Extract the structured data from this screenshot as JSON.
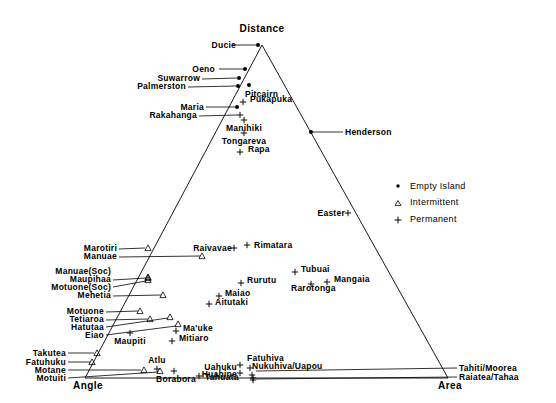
{
  "figure": {
    "type": "ternary-scatter",
    "width": 556,
    "height": 403,
    "background": "#ffffff",
    "ink_color": "#000000"
  },
  "vertices": {
    "top": "Distance",
    "bottom_left": "Angle",
    "bottom_right": "Area"
  },
  "legend": {
    "entries": [
      {
        "marker": "dot",
        "label": "Empty Island"
      },
      {
        "marker": "triangle",
        "label": "Intermittent"
      },
      {
        "marker": "plus",
        "label": "Permanent"
      }
    ]
  },
  "chart_data": {
    "type": "scatter",
    "title": "",
    "xlabel": "",
    "ylabel": "",
    "axes": {
      "top_vertex": "Distance",
      "left_vertex": "Angle",
      "right_vertex": "Area"
    },
    "legend_position": "right",
    "grid": false,
    "marker_classes": [
      "Empty Island",
      "Intermittent",
      "Permanent"
    ],
    "points": [
      {
        "name": "Ducie",
        "class": "Empty Island",
        "x": 258,
        "y": 45,
        "label_x": 236,
        "label_y": 45,
        "label_align": "right",
        "leader": [
          232,
          45,
          256,
          45
        ]
      },
      {
        "name": "Oeno",
        "class": "Empty Island",
        "x": 245,
        "y": 69,
        "label_x": 215,
        "label_y": 69,
        "label_align": "right",
        "leader": [
          219,
          69,
          243,
          69
        ]
      },
      {
        "name": "Suwarrow",
        "class": "Empty Island",
        "x": 239,
        "y": 78,
        "label_x": 200,
        "label_y": 78,
        "label_align": "right",
        "leader": [
          202,
          79,
          237,
          78
        ]
      },
      {
        "name": "Palmerston",
        "class": "Empty Island",
        "x": 238,
        "y": 86,
        "label_x": 186,
        "label_y": 86,
        "label_align": "right",
        "leader": [
          188,
          87,
          236,
          86
        ]
      },
      {
        "name": "Pitcairn",
        "class": "Empty Island",
        "x": 249,
        "y": 85,
        "label_x": 245,
        "label_y": 94,
        "label_align": "left",
        "leader": null
      },
      {
        "name": "Pukapuka",
        "class": "Permanent",
        "x": 243,
        "y": 102,
        "label_x": 250,
        "label_y": 99,
        "label_align": "left",
        "leader": null
      },
      {
        "name": "Maria",
        "class": "Empty Island",
        "x": 237,
        "y": 107,
        "label_x": 204,
        "label_y": 107,
        "label_align": "right",
        "leader": [
          206,
          107,
          235,
          107
        ]
      },
      {
        "name": "Rakahanga",
        "class": "Permanent",
        "x": 240,
        "y": 115,
        "label_x": 197,
        "label_y": 115,
        "label_align": "right",
        "leader": [
          199,
          116,
          237,
          115
        ]
      },
      {
        "name": "Manihiki",
        "class": "Permanent",
        "x": 244,
        "y": 120,
        "label_x": 244,
        "label_y": 128,
        "label_align": "center",
        "leader": null
      },
      {
        "name": "Tongareva",
        "class": "Permanent",
        "x": 244,
        "y": 133,
        "label_x": 244,
        "label_y": 141,
        "label_align": "center",
        "leader": null
      },
      {
        "name": "Rapa",
        "class": "Permanent",
        "x": 240,
        "y": 152,
        "label_x": 248,
        "label_y": 149,
        "label_align": "left",
        "leader": null
      },
      {
        "name": "Henderson",
        "class": "Empty Island",
        "x": 311,
        "y": 132,
        "label_x": 345,
        "label_y": 132,
        "label_align": "left",
        "leader": [
          313,
          132,
          343,
          132
        ]
      },
      {
        "name": "Easter",
        "class": "Permanent",
        "x": 348,
        "y": 213,
        "label_x": 345,
        "label_y": 213,
        "label_align": "right",
        "leader": null
      },
      {
        "name": "Marotiri",
        "class": "Intermittent",
        "x": 148,
        "y": 248,
        "label_x": 117,
        "label_y": 248,
        "label_align": "right",
        "leader": [
          119,
          249,
          145,
          248
        ]
      },
      {
        "name": "Manuae",
        "class": "Intermittent",
        "x": 202,
        "y": 256,
        "label_x": 117,
        "label_y": 256,
        "label_align": "right",
        "leader": [
          119,
          257,
          200,
          256
        ]
      },
      {
        "name": "Raivavae",
        "class": "Permanent",
        "x": 234,
        "y": 248,
        "label_x": 232,
        "label_y": 248,
        "label_align": "right",
        "leader": null
      },
      {
        "name": "Rimatara",
        "class": "Permanent",
        "x": 247,
        "y": 245,
        "label_x": 254,
        "label_y": 245,
        "label_align": "left",
        "leader": null
      },
      {
        "name": "Manuae(Soc)",
        "class": "Intermittent",
        "x": 148,
        "y": 277,
        "label_x": 111,
        "label_y": 271,
        "label_align": "right",
        "leader": null
      },
      {
        "name": "Maupihaa",
        "class": "Intermittent",
        "x": 148,
        "y": 278,
        "label_x": 111,
        "label_y": 279,
        "label_align": "right",
        "leader": [
          113,
          280,
          146,
          278
        ]
      },
      {
        "name": "Motuone(Soc)",
        "class": "Intermittent",
        "x": 148,
        "y": 280,
        "label_x": 111,
        "label_y": 287,
        "label_align": "right",
        "leader": [
          113,
          287,
          146,
          281
        ]
      },
      {
        "name": "Mehetia",
        "class": "Intermittent",
        "x": 163,
        "y": 295,
        "label_x": 111,
        "label_y": 295,
        "label_align": "right",
        "leader": [
          113,
          296,
          161,
          295
        ]
      },
      {
        "name": "Tubuai",
        "class": "Permanent",
        "x": 295,
        "y": 272,
        "label_x": 301,
        "label_y": 269,
        "label_align": "left",
        "leader": null
      },
      {
        "name": "Mangaia",
        "class": "Permanent",
        "x": 327,
        "y": 282,
        "label_x": 334,
        "label_y": 279,
        "label_align": "left",
        "leader": null
      },
      {
        "name": "Rurutu",
        "class": "Permanent",
        "x": 241,
        "y": 283,
        "label_x": 247,
        "label_y": 280,
        "label_align": "left",
        "leader": null
      },
      {
        "name": "Rarotonga",
        "class": "Permanent",
        "x": 311,
        "y": 284,
        "label_x": 291,
        "label_y": 288,
        "label_align": "left",
        "leader": null
      },
      {
        "name": "Maiao",
        "class": "Permanent",
        "x": 219,
        "y": 296,
        "label_x": 225,
        "label_y": 293,
        "label_align": "left",
        "leader": null
      },
      {
        "name": "Aitutaki",
        "class": "Permanent",
        "x": 209,
        "y": 304,
        "label_x": 215,
        "label_y": 302,
        "label_align": "left",
        "leader": null
      },
      {
        "name": "Motuone",
        "class": "Intermittent",
        "x": 140,
        "y": 311,
        "label_x": 104,
        "label_y": 311,
        "label_align": "right",
        "leader": [
          106,
          312,
          138,
          311
        ]
      },
      {
        "name": "Tetiaroa",
        "class": "Intermittent",
        "x": 150,
        "y": 319,
        "label_x": 104,
        "label_y": 319,
        "label_align": "right",
        "leader": [
          106,
          320,
          148,
          319
        ]
      },
      {
        "name": "Hatutaa",
        "class": "Intermittent",
        "x": 170,
        "y": 317,
        "label_x": 104,
        "label_y": 327,
        "label_align": "right",
        "leader": [
          106,
          327,
          168,
          318
        ]
      },
      {
        "name": "Eiao",
        "class": "Intermittent",
        "x": 178,
        "y": 324,
        "label_x": 104,
        "label_y": 335,
        "label_align": "right",
        "leader": [
          106,
          335,
          176,
          326
        ]
      },
      {
        "name": "Ma'uke",
        "class": "Permanent",
        "x": 176,
        "y": 331,
        "label_x": 183,
        "label_y": 328,
        "label_align": "left",
        "leader": null
      },
      {
        "name": "Maupiti",
        "class": "Permanent",
        "x": 130,
        "y": 333,
        "label_x": 130,
        "label_y": 341,
        "label_align": "center",
        "leader": null
      },
      {
        "name": "Mitiaro",
        "class": "Permanent",
        "x": 172,
        "y": 341,
        "label_x": 179,
        "label_y": 338,
        "label_align": "left",
        "leader": null
      },
      {
        "name": "Takutea",
        "class": "Intermittent",
        "x": 97,
        "y": 353,
        "label_x": 66,
        "label_y": 353,
        "label_align": "right",
        "leader": [
          68,
          353,
          94,
          353
        ]
      },
      {
        "name": "Fatuhuku",
        "class": "Intermittent",
        "x": 92,
        "y": 362,
        "label_x": 66,
        "label_y": 362,
        "label_align": "right",
        "leader": [
          68,
          362,
          90,
          362
        ]
      },
      {
        "name": "Motane",
        "class": "Intermittent",
        "x": 144,
        "y": 370,
        "label_x": 66,
        "label_y": 370,
        "label_align": "right",
        "leader": [
          68,
          370,
          141,
          370
        ]
      },
      {
        "name": "Motuiti",
        "class": "Intermittent",
        "x": 160,
        "y": 371,
        "label_x": 66,
        "label_y": 378,
        "label_align": "right",
        "leader": [
          68,
          378,
          158,
          372
        ]
      },
      {
        "name": "Atlu",
        "class": "Permanent",
        "x": 157,
        "y": 369,
        "label_x": 157,
        "label_y": 360,
        "label_align": "center",
        "leader": null
      },
      {
        "name": "Borabora",
        "class": "Permanent",
        "x": 174,
        "y": 371,
        "label_x": 176,
        "label_y": 379,
        "label_align": "center",
        "leader": null
      },
      {
        "name": "Tahuata",
        "class": "Permanent",
        "x": 199,
        "y": 376,
        "label_x": 205,
        "label_y": 377,
        "label_align": "left",
        "leader": null
      },
      {
        "name": "Uahuku",
        "class": "Permanent",
        "x": 240,
        "y": 365,
        "label_x": 237,
        "label_y": 367,
        "label_align": "right",
        "leader": null
      },
      {
        "name": "Huahine",
        "class": "Permanent",
        "x": 240,
        "y": 373,
        "label_x": 237,
        "label_y": 374,
        "label_align": "right",
        "leader": null
      },
      {
        "name": "Fatuhiva",
        "class": "Permanent",
        "x": 250,
        "y": 368,
        "label_x": 247,
        "label_y": 358,
        "label_align": "left",
        "leader": null
      },
      {
        "name": "Nukuhiva/Uapou",
        "class": "Permanent",
        "x": 252,
        "y": 375,
        "label_x": 252,
        "label_y": 366,
        "label_align": "left",
        "leader": null
      },
      {
        "name": "Tahiti/Moorea",
        "class": "Permanent",
        "x": 253,
        "y": 378,
        "label_x": 459,
        "label_y": 368,
        "label_align": "left",
        "leader": [
          256,
          371,
          457,
          368
        ]
      },
      {
        "name": "Raiatea/Tahaa",
        "class": "Permanent",
        "x": 253,
        "y": 380,
        "label_x": 459,
        "label_y": 377,
        "label_align": "left",
        "leader": [
          256,
          379,
          457,
          377
        ]
      }
    ]
  }
}
